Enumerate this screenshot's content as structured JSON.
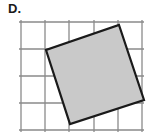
{
  "figure": {
    "choice_label": "D.",
    "colors": {
      "background": "#ffffff",
      "grid_line": "#8a8a8a",
      "shape_outline": "#1a1a1a",
      "shape_fill": "#c9c9c9",
      "label_text": "#1a1a1a"
    },
    "grid": {
      "vertical_line_x": [
        21,
        45,
        69,
        94,
        118,
        142
      ],
      "horizontal_line_y": [
        22,
        49,
        76,
        103,
        130
      ],
      "cell_width": 24,
      "cell_height": 27,
      "columns": 5,
      "rows": 4,
      "stroke_width": 1.3
    },
    "shape": {
      "type": "square",
      "vertices": [
        {
          "name": "top",
          "x": 119,
          "y": 25
        },
        {
          "name": "right",
          "x": 144,
          "y": 100
        },
        {
          "name": "bottom",
          "x": 70,
          "y": 124
        },
        {
          "name": "left",
          "x": 46,
          "y": 50
        }
      ],
      "points_attr": "119,25 144,100 70,124 46,50",
      "stroke_width": 2.2
    }
  }
}
